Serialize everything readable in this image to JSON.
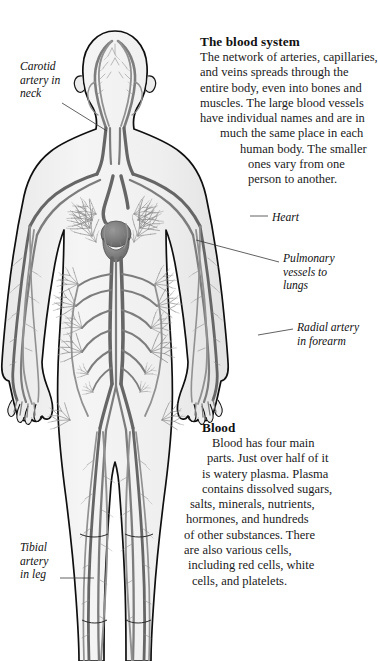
{
  "page": {
    "title": "The blood system",
    "width": 374,
    "height": 661,
    "background": "#ffffff"
  },
  "colors": {
    "text": "#111111",
    "vessel": "#7d7d7d",
    "vessel_dark": "#5e5e5e",
    "body_fill": "#f2f2f2",
    "body_outline": "#111111",
    "leader_line": "#444444"
  },
  "illustration": {
    "name": "human-circulatory-system-figure",
    "subject": "front view of a human body showing arteries, veins and capillary networks",
    "parts": [
      "head",
      "neck",
      "torso",
      "left arm",
      "right arm",
      "left leg",
      "right leg",
      "heart",
      "lungs"
    ]
  },
  "sections": [
    {
      "id": "blood-system",
      "heading": "The blood system",
      "body": "The network of arteries, capillaries, and veins spreads through the entire body, even into bones and muscles. The large blood vessels have individual names and are in much the same place in each human body. The smaller ones vary from one person to another.",
      "lines": [
        "The network of arteries, capillaries,",
        "and veins spreads through the",
        "entire body, even into bones and",
        "muscles. The large blood vessels",
        "have individual names and are in",
        "much the same place in each",
        "human body. The smaller",
        "ones vary from one",
        "person to another."
      ]
    },
    {
      "id": "blood",
      "heading": "Blood",
      "body": "Blood has four main parts. Just over half of it is watery plasma. Plasma contains dissolved sugars, salts, minerals, nutrients, hormones, and hundreds of other substances. There are also various cells, including red cells, white cells, and platelets.",
      "lines": [
        "Blood has four main",
        "parts. Just over half of it",
        "is watery plasma. Plasma",
        "contains dissolved sugars,",
        "salts, minerals, nutrients,",
        "hormones, and hundreds",
        "of other substances. There",
        "are also various cells,",
        "including red cells, white",
        "cells, and platelets."
      ]
    }
  ],
  "labels": [
    {
      "id": "carotid",
      "text": "Carotid\nartery in\nneck",
      "side": "left"
    },
    {
      "id": "tibial",
      "text": "Tibial\nartery\nin leg",
      "side": "left"
    },
    {
      "id": "heart",
      "text": "Heart",
      "side": "right"
    },
    {
      "id": "pulmonary",
      "text": "Pulmonary\nvessels to\nlungs",
      "side": "right"
    },
    {
      "id": "radial",
      "text": "Radial artery\nin forearm",
      "side": "right"
    }
  ]
}
